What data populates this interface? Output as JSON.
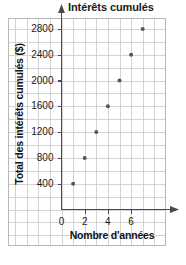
{
  "chart_data": {
    "type": "scatter",
    "title": "Intérêts cumulés",
    "xlabel": "Nombre d'années",
    "ylabel": "Total des intérêts cumulés ($)",
    "x": [
      1,
      2,
      3,
      4,
      5,
      6,
      7
    ],
    "values": [
      400,
      800,
      1200,
      1600,
      2000,
      2400,
      2800
    ],
    "points": [
      {
        "x": 1,
        "y": 400
      },
      {
        "x": 2,
        "y": 800
      },
      {
        "x": 3,
        "y": 1200
      },
      {
        "x": 4,
        "y": 1600
      },
      {
        "x": 5,
        "y": 2000
      },
      {
        "x": 6,
        "y": 2400
      },
      {
        "x": 7,
        "y": 2800
      }
    ],
    "xticks": [
      "0",
      "2",
      "4",
      "6"
    ],
    "xtick_values": [
      0,
      2,
      4,
      6
    ],
    "yticks": [
      "400",
      "800",
      "1200",
      "1600",
      "2000",
      "2400",
      "2800"
    ],
    "ytick_values": [
      400,
      800,
      1200,
      1600,
      2000,
      2400,
      2800
    ],
    "xlim": [
      0,
      8
    ],
    "ylim": [
      0,
      3000
    ],
    "grid": true,
    "legend": "none",
    "marker_color": "#555555",
    "axis_color": "#4a4a4a",
    "grid_color": "#c9c9c9",
    "border_color": "#b9b9b9",
    "text_color": "#1a1a1a"
  }
}
